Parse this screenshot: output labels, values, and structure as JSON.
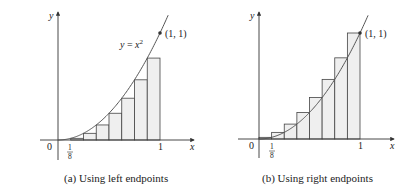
{
  "chart_data": [
    {
      "type": "bar",
      "title": "(a) Using left endpoints",
      "function": "y = x^2",
      "xlabel": "x",
      "ylabel": "y",
      "x_ticks": [
        "0",
        "1/8",
        "1"
      ],
      "point_label": "(1, 1)",
      "curve_label": "y = x²",
      "n": 8,
      "categories": [
        "0",
        "1/8",
        "2/8",
        "3/8",
        "4/8",
        "5/8",
        "6/8",
        "7/8"
      ],
      "values": [
        0,
        0.015625,
        0.0625,
        0.140625,
        0.25,
        0.390625,
        0.5625,
        0.765625
      ],
      "xlim": [
        0,
        1
      ],
      "ylim": [
        0,
        1
      ]
    },
    {
      "type": "bar",
      "title": "(b) Using right endpoints",
      "function": "y = x^2",
      "xlabel": "x",
      "ylabel": "y",
      "x_ticks": [
        "0",
        "1/8",
        "1"
      ],
      "point_label": "(1, 1)",
      "n": 8,
      "categories": [
        "1/8",
        "2/8",
        "3/8",
        "4/8",
        "5/8",
        "6/8",
        "7/8",
        "1"
      ],
      "values": [
        0.015625,
        0.0625,
        0.140625,
        0.25,
        0.390625,
        0.5625,
        0.765625,
        1
      ],
      "xlim": [
        0,
        1
      ],
      "ylim": [
        0,
        1
      ]
    }
  ],
  "panels": [
    {
      "caption": "(a) Using left endpoints",
      "y_label": "y",
      "x_label": "x",
      "origin": "0",
      "one": "1",
      "frac_num": "1",
      "frac_den": "8",
      "point": "(1, 1)",
      "curve_eq": "y = x",
      "curve_exp": "2"
    },
    {
      "caption": "(b) Using right endpoints",
      "y_label": "y",
      "x_label": "x",
      "origin": "0",
      "one": "1",
      "frac_num": "1",
      "frac_den": "8",
      "point": "(1, 1)"
    }
  ]
}
